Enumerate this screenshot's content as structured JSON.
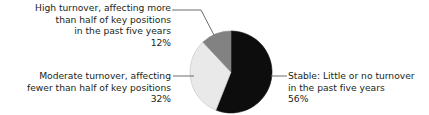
{
  "chart_data": {
    "type": "pie",
    "title": "",
    "categories": [
      "Stable: Little or no turnover in the past five years",
      "Moderate turnover, affecting fewer than half of key positions",
      "High turnover, affecting more than half of key positions in the past five years"
    ],
    "values": [
      56,
      32,
      12
    ],
    "value_labels": [
      "56%",
      "32%",
      "12%"
    ],
    "units": "percent",
    "legend_position": "callout-labels",
    "grid": false,
    "slice_colors": [
      "#0d0d0d",
      "#e9e9e9",
      "#828282"
    ],
    "slices": [
      {
        "key": "stable",
        "value": 56,
        "value_label": "56%",
        "color": "#0d0d0d",
        "start_angle_deg": 0,
        "end_angle_deg": 201.6,
        "label_lines": [
          "Stable: Little or no turnover",
          "in the past five years",
          "56%"
        ]
      },
      {
        "key": "moderate",
        "value": 32,
        "value_label": "32%",
        "color": "#e9e9e9",
        "start_angle_deg": 201.6,
        "end_angle_deg": 316.8,
        "label_lines": [
          "Moderate turnover, affecting",
          "fewer than half of key positions",
          "32%"
        ]
      },
      {
        "key": "high",
        "value": 12,
        "value_label": "12%",
        "color": "#828282",
        "start_angle_deg": 316.8,
        "end_angle_deg": 360,
        "label_lines": [
          "High turnover, affecting more",
          "than half of key positions",
          "in the past five years",
          "12%"
        ]
      }
    ]
  },
  "labels": {
    "high": {
      "line1": "High turnover, affecting more",
      "line2": "than half of key positions",
      "line3": "in the past five years",
      "line4": "12%"
    },
    "moderate": {
      "line1": "Moderate turnover, affecting",
      "line2": "fewer than half of key positions",
      "line3": "32%"
    },
    "stable": {
      "line1": "Stable: Little or no turnover",
      "line2": "in the past five years",
      "line3": "56%"
    }
  },
  "style": {
    "text_color": "#231f20",
    "leader_color": "#6c6c6c",
    "pie_outline": "#bdbdbd",
    "background": "#ffffff"
  }
}
